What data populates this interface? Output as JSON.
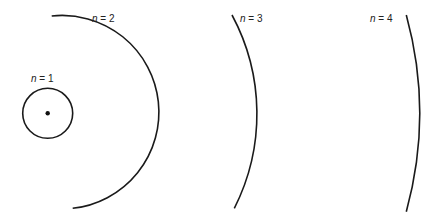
{
  "diagram": {
    "center": {
      "x": 47.7,
      "y": 113.3
    },
    "nucleus": {
      "radius": 2.2,
      "color": "#111111"
    },
    "stroke_color": "#1a1a1a",
    "orbits": [
      {
        "n": 1,
        "label_var": "n",
        "label_eq": " = ",
        "label_num": "1",
        "radius": 25,
        "full_circle": true,
        "label_x": 31,
        "label_y": 82
      },
      {
        "n": 2,
        "label_var": "n",
        "label_eq": " = ",
        "label_num": "2",
        "radius": 96.3,
        "start": {
          "x": 51.7,
          "y": 16
        },
        "end": {
          "x": 72.7,
          "y": 208.3
        },
        "label_x": 92,
        "label_y": 22
      },
      {
        "n": 3,
        "label_var": "n",
        "label_eq": " = ",
        "label_num": "3",
        "radius": 208.6,
        "start": {
          "x": 232,
          "y": 15
        },
        "end": {
          "x": 234.3,
          "y": 208.3
        },
        "label_x": 240,
        "label_y": 22
      },
      {
        "n": 4,
        "label_var": "n",
        "label_eq": " = ",
        "label_num": "4",
        "radius": 371.6,
        "start": {
          "x": 406.3,
          "y": 15
        },
        "end": {
          "x": 406.3,
          "y": 211.7
        },
        "label_x": 370,
        "label_y": 22
      }
    ]
  }
}
